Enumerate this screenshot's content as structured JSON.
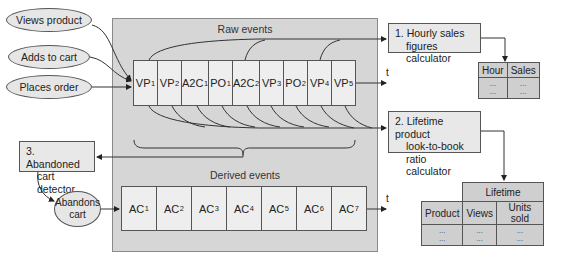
{
  "inputs": [
    {
      "label": "Views product"
    },
    {
      "label": "Adds to cart"
    },
    {
      "label": "Places order"
    }
  ],
  "raw_events": {
    "title": "Raw events",
    "cells": [
      {
        "name": "VP",
        "sub": "1"
      },
      {
        "name": "VP",
        "sub": "2"
      },
      {
        "name": "A2C",
        "sub": "1"
      },
      {
        "name": "PO",
        "sub": "1"
      },
      {
        "name": "A2C",
        "sub": "2"
      },
      {
        "name": "VP",
        "sub": "3"
      },
      {
        "name": "PO",
        "sub": "2"
      },
      {
        "name": "VP",
        "sub": "4"
      },
      {
        "name": "VP",
        "sub": "5"
      }
    ],
    "time_label": "t"
  },
  "derived_events": {
    "title": "Derived events",
    "cells": [
      {
        "name": "AC",
        "sub": "1"
      },
      {
        "name": "AC",
        "sub": "2"
      },
      {
        "name": "AC",
        "sub": "3"
      },
      {
        "name": "AC",
        "sub": "4"
      },
      {
        "name": "AC",
        "sub": "5"
      },
      {
        "name": "AC",
        "sub": "6"
      },
      {
        "name": "AC",
        "sub": "7"
      }
    ],
    "time_label": "t"
  },
  "processors": [
    {
      "line1": "1. Hourly sales",
      "line2": "figures calculator"
    },
    {
      "line1": "2. Lifetime product",
      "line2": "look-to-book",
      "line3": "ratio calculator"
    },
    {
      "line1": "3. Abandoned",
      "line2": "cart detector"
    }
  ],
  "abandons_cart": {
    "line1": "Abandons",
    "line2": "cart"
  },
  "hourly_table": {
    "headers": [
      "Hour",
      "Sales"
    ],
    "rows": [
      [
        "...",
        "..."
      ],
      [
        "...",
        "..."
      ]
    ]
  },
  "lifetime_table": {
    "group_header": "Lifetime",
    "headers": [
      "Product",
      "Views",
      "Units sold"
    ],
    "rows": [
      [
        "...",
        "...",
        "..."
      ],
      [
        "...",
        "...",
        "..."
      ]
    ]
  },
  "colors": {
    "panel": "#d6d6d6",
    "cell": "#eeeeee",
    "box": "#e8e8e8",
    "table": "#cfcfcf",
    "line": "#333333"
  }
}
